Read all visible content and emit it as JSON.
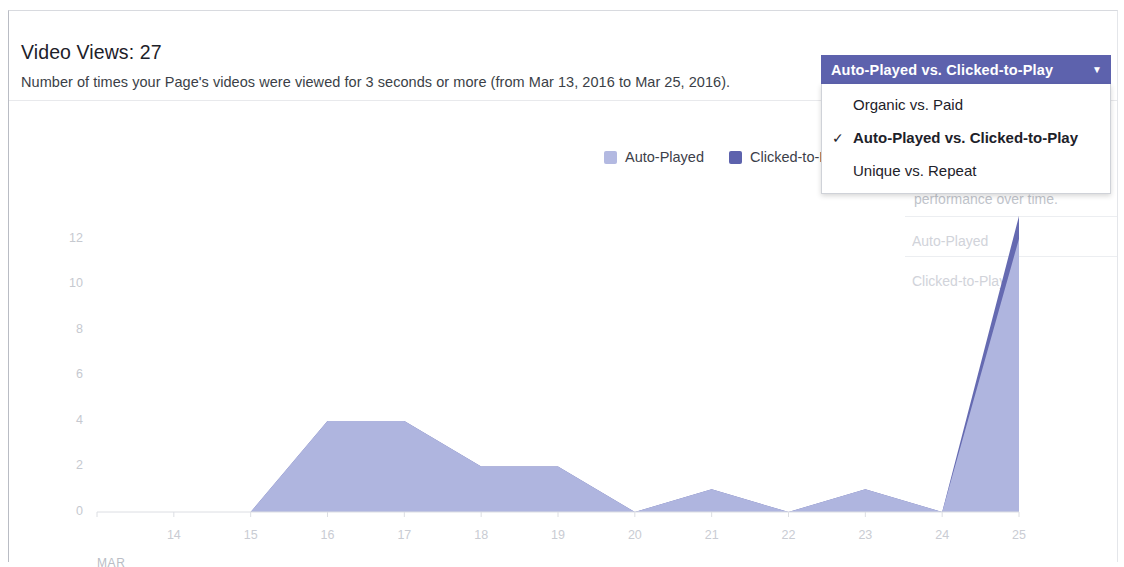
{
  "card": {
    "title": "Video Views: 27",
    "description": "Number of times your Page's videos were viewed for 3 seconds or more (from Mar 13, 2016 to Mar 25, 2016)."
  },
  "selector": {
    "current_label": "Auto-Played vs. Clicked-to-Play",
    "caret_icon": "▼",
    "check_icon": "✓",
    "options": [
      {
        "label": "Organic vs. Paid",
        "selected": false
      },
      {
        "label": "Auto-Played vs. Clicked-to-Play",
        "selected": true
      },
      {
        "label": "Unique vs. Repeat",
        "selected": false
      }
    ]
  },
  "background_panel": {
    "partial_text": "performance over time.",
    "items": [
      "Auto-Played",
      "Clicked-to-Play"
    ]
  },
  "legend": [
    {
      "label": "Auto-Played",
      "color": "#b3b9e1"
    },
    {
      "label": "Clicked-to-Play",
      "color": "#5d62ad"
    }
  ],
  "colors": {
    "auto_played_fill": "#b3b9e1",
    "clicked_to_play_fill": "#5d62ad",
    "accent": "#5d62ad",
    "axis_text": "#c6c9d0",
    "card_border": "#b9bcc4"
  },
  "chart_data": {
    "type": "area",
    "title": "Video Views: 27",
    "stacked": true,
    "xlabel": "MAR",
    "ylabel": "",
    "ylim": [
      0,
      13
    ],
    "grid": false,
    "legend_position": "top-right",
    "categories": [
      "13",
      "14",
      "15",
      "16",
      "17",
      "18",
      "19",
      "20",
      "21",
      "22",
      "23",
      "24",
      "25"
    ],
    "x_tick_labels": [
      "14",
      "15",
      "16",
      "17",
      "18",
      "19",
      "20",
      "21",
      "22",
      "23",
      "24",
      "25"
    ],
    "y_tick_labels": [
      "0",
      "2",
      "4",
      "6",
      "8",
      "10",
      "12"
    ],
    "y_ticks": [
      0,
      2,
      4,
      6,
      8,
      10,
      12
    ],
    "series": [
      {
        "name": "Auto-Played",
        "color": "#b3b9e1",
        "values": [
          0,
          0,
          0,
          4,
          4,
          2,
          2,
          0,
          1,
          0,
          1,
          0,
          12
        ]
      },
      {
        "name": "Clicked-to-Play",
        "color": "#5d62ad",
        "values": [
          0,
          0,
          0,
          0,
          0,
          0,
          0,
          0,
          0,
          0,
          0,
          0,
          1
        ]
      }
    ]
  }
}
